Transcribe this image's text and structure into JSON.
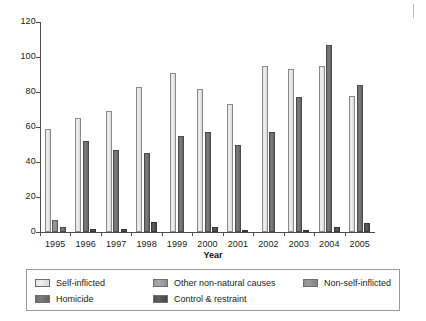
{
  "chart_data": {
    "type": "bar",
    "title": "",
    "subtitle": "",
    "xlabel": "Year",
    "ylabel": "",
    "categories": [
      "1995",
      "1996",
      "1997",
      "1998",
      "1999",
      "2000",
      "2001",
      "2002",
      "2003",
      "2004",
      "2005"
    ],
    "ylim": [
      0,
      120
    ],
    "yticks": [
      0,
      20,
      40,
      60,
      80,
      100,
      120
    ],
    "grid": false,
    "legend_position": "bottom",
    "series": [
      {
        "name": "Self-inflicted",
        "color": "#e8e8e8",
        "values": [
          59,
          65,
          69,
          83,
          91,
          82,
          73,
          95,
          93,
          95,
          78
        ]
      },
      {
        "name": "Other non-natural causes",
        "color": "#a3a3a3",
        "values": [
          0,
          0,
          0,
          0,
          0,
          0,
          0,
          0,
          0,
          0,
          0
        ]
      },
      {
        "name": "Non-self-inflicted",
        "color": "#949494",
        "values": [
          7,
          0,
          0,
          0,
          0,
          0,
          0,
          0,
          0,
          0,
          0
        ]
      },
      {
        "name": "Homicide",
        "color": "#727272",
        "values": [
          3,
          52,
          47,
          45,
          55,
          57,
          50,
          57,
          77,
          107,
          84
        ]
      },
      {
        "name": "Control & restraint",
        "color": "#525252",
        "values": [
          0,
          2,
          2,
          6,
          0,
          3,
          1,
          0,
          1,
          3,
          5
        ]
      }
    ]
  },
  "axis": {
    "y_tick_labels": [
      "0",
      "20",
      "40",
      "60",
      "80",
      "100",
      "120"
    ],
    "x_tick_labels": [
      "1995",
      "1996",
      "1997",
      "1998",
      "1999",
      "2000",
      "2001",
      "2002",
      "2003",
      "2004",
      "2005"
    ],
    "x_title": "Year"
  },
  "legend": {
    "entries": [
      {
        "label": "Self-inflicted",
        "color": "#e8e8e8"
      },
      {
        "label": "Other non-natural causes",
        "color": "#a3a3a3"
      },
      {
        "label": "Non-self-inflicted",
        "color": "#949494"
      },
      {
        "label": "Homicide",
        "color": "#727272"
      },
      {
        "label": "Control & restraint",
        "color": "#525252"
      }
    ]
  }
}
